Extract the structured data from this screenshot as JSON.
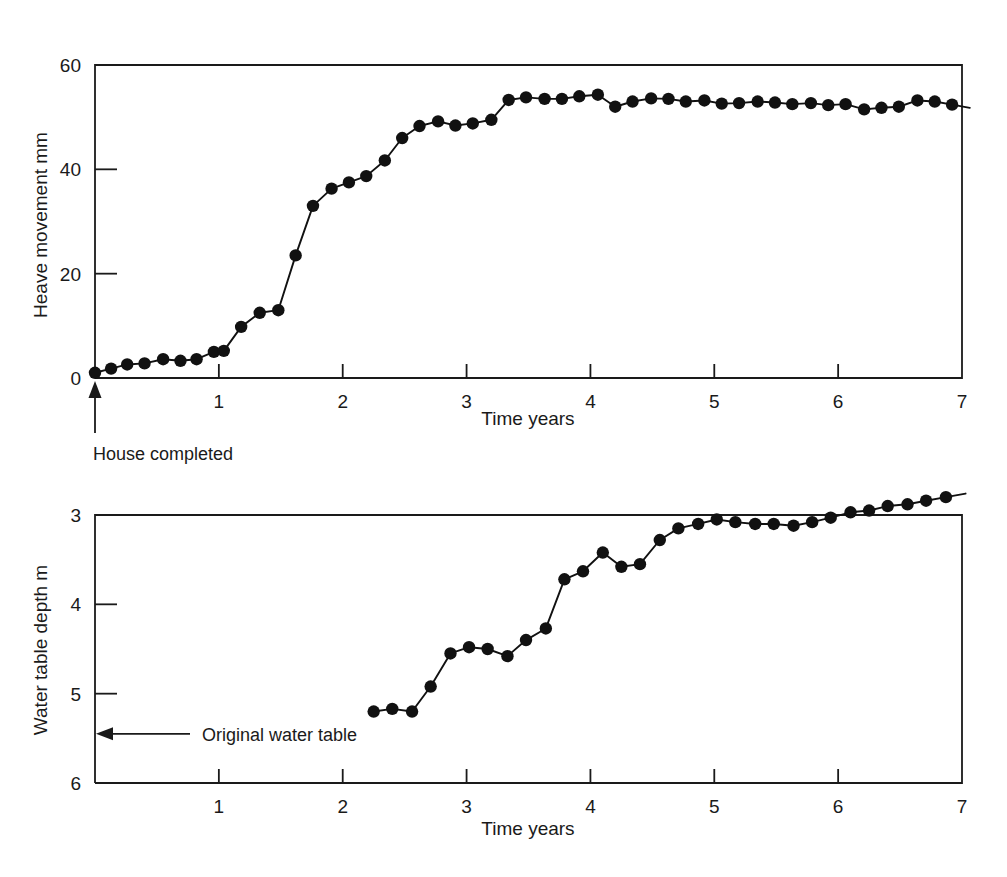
{
  "figure": {
    "background": "#ffffff",
    "ink": "#111111"
  },
  "chart_data": [
    {
      "id": "heave-chart",
      "type": "line",
      "title": "",
      "xlabel": "Time years",
      "ylabel": "Heave movement mm",
      "xlim": [
        0,
        7
      ],
      "ylim": [
        0,
        60
      ],
      "xticks": [
        1,
        2,
        3,
        4,
        5,
        6,
        7
      ],
      "xticklabels": [
        "1",
        "2",
        "3",
        "4",
        "5",
        "6",
        "7"
      ],
      "yticks": [
        0,
        20,
        40,
        60
      ],
      "yticklabels": [
        "0",
        "20",
        "40",
        "60"
      ],
      "grid": false,
      "legend": null,
      "markers": "filled-circle",
      "annotations": [
        {
          "text": "House completed",
          "kind": "up-arrow",
          "x": 0.0,
          "y": 0.0
        }
      ],
      "series": [
        {
          "name": "Heave movement",
          "x": [
            0.0,
            0.13,
            0.26,
            0.4,
            0.55,
            0.69,
            0.82,
            0.96,
            1.04,
            1.18,
            1.33,
            1.48,
            1.62,
            1.76,
            1.91,
            2.05,
            2.19,
            2.34,
            2.48,
            2.62,
            2.77,
            2.91,
            3.05,
            3.2,
            3.34,
            3.48,
            3.63,
            3.77,
            3.91,
            4.06,
            4.2,
            4.34,
            4.49,
            4.63,
            4.77,
            4.92,
            5.06,
            5.2,
            5.35,
            5.49,
            5.63,
            5.78,
            5.92,
            6.06,
            6.21,
            6.35,
            6.49,
            6.64,
            6.78,
            6.92
          ],
          "y": [
            1.0,
            1.8,
            2.6,
            2.8,
            3.6,
            3.3,
            3.6,
            5.0,
            5.2,
            9.8,
            12.5,
            13.0,
            23.5,
            33.0,
            36.3,
            37.5,
            38.7,
            41.7,
            46.0,
            48.3,
            49.2,
            48.4,
            48.8,
            49.5,
            53.3,
            53.8,
            53.5,
            53.5,
            54.0,
            54.3,
            52.0,
            53.0,
            53.6,
            53.5,
            53.0,
            53.2,
            52.6,
            52.7,
            53.0,
            52.8,
            52.5,
            52.7,
            52.3,
            52.5,
            51.5,
            51.8,
            52.0,
            53.2,
            53.0,
            52.4
          ]
        }
      ]
    },
    {
      "id": "water-table-chart",
      "type": "line",
      "title": "",
      "xlabel": "Time years",
      "ylabel": "Water table depth m",
      "xlim": [
        0,
        7
      ],
      "ylim": [
        6,
        3
      ],
      "y_axis_inverted": true,
      "xticks": [
        1,
        2,
        3,
        4,
        5,
        6,
        7
      ],
      "xticklabels": [
        "1",
        "2",
        "3",
        "4",
        "5",
        "6",
        "7"
      ],
      "yticks": [
        3,
        4,
        5,
        6
      ],
      "yticklabels": [
        "3",
        "4",
        "5",
        "6"
      ],
      "grid": false,
      "legend": null,
      "markers": "filled-circle",
      "annotations": [
        {
          "text": "Original water table",
          "kind": "left-arrow",
          "x": 0.0,
          "y": 5.45
        }
      ],
      "series": [
        {
          "name": "Water table depth",
          "x": [
            2.25,
            2.4,
            2.56,
            2.71,
            2.87,
            3.02,
            3.17,
            3.33,
            3.48,
            3.64,
            3.79,
            3.94,
            4.1,
            4.25,
            4.4,
            4.56,
            4.71,
            4.87,
            5.02,
            5.17,
            5.33,
            5.48,
            5.64,
            5.79,
            5.94,
            6.1,
            6.25,
            6.4,
            6.56,
            6.71,
            6.87
          ],
          "y": [
            5.2,
            5.17,
            5.2,
            4.92,
            4.55,
            4.48,
            4.5,
            4.58,
            4.4,
            4.27,
            3.72,
            3.63,
            3.42,
            3.58,
            3.55,
            3.28,
            3.15,
            3.1,
            3.05,
            3.08,
            3.1,
            3.1,
            3.12,
            3.08,
            3.03,
            2.97,
            2.95,
            2.9,
            2.88,
            2.84,
            2.8
          ]
        }
      ]
    }
  ]
}
